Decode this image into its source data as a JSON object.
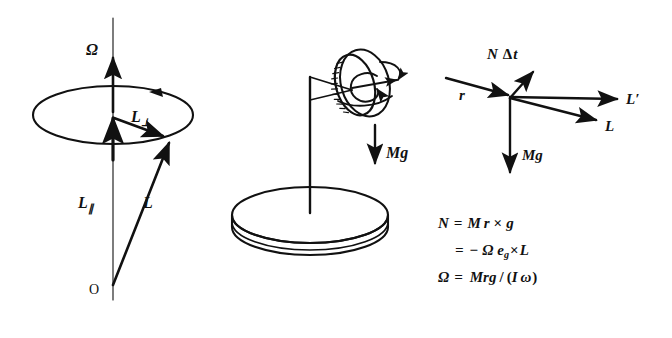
{
  "figure": {
    "background_color": "#ffffff",
    "ink_color": "#111111"
  },
  "panels": {
    "left": {
      "name": "angular-momentum-cone",
      "labels": {
        "omega_axis": "Ω",
        "l_perp": "L",
        "l_perp_sub": "⊥",
        "l_parallel": "L",
        "l_parallel_sub": "∥",
        "l_total": "L",
        "origin": "O"
      }
    },
    "middle": {
      "name": "spinning-top-on-stand",
      "labels": {
        "weight": "M",
        "weight_vec": "g"
      }
    },
    "right": {
      "name": "torque-impulse-vector-diagram",
      "labels": {
        "torque_impulse": "N",
        "torque_impulse_delta": "Δ",
        "torque_impulse_t": "t",
        "radius": "r",
        "l_new": "L′",
        "l_old": "L",
        "weight": "M",
        "weight_vec": "g"
      }
    }
  },
  "equations": [
    {
      "id": "eq-torque",
      "lhs": "N",
      "rel": "=",
      "rhs": "M r × g",
      "display": "N = M r × g"
    },
    {
      "id": "eq-torque-alt",
      "lhs": "",
      "rel": "=",
      "rhs": "− Ω eᵧ × L",
      "display": "= − Ω eᵧ × L"
    },
    {
      "id": "eq-precession-rate",
      "lhs": "Ω",
      "rel": "=",
      "rhs": "Mrg / (I ω)",
      "display": "Ω = Mrg / (I ω)"
    }
  ],
  "equation_tokens": {
    "line1": {
      "n": "N",
      "eq": "=",
      "m": "M",
      "r": "r",
      "times": "×",
      "g": "g"
    },
    "line2": {
      "eq": "=",
      "minus": "−",
      "omega": "Ω",
      "e": "e",
      "e_sub": "g",
      "times": "×",
      "l": "L"
    },
    "line3": {
      "omega_big": "Ω",
      "eq": "=",
      "mrg": "Mrg",
      "slash": "/",
      "paren_open": "(",
      "i": "I",
      "omega_small": "ω",
      "paren_close": ")"
    }
  }
}
